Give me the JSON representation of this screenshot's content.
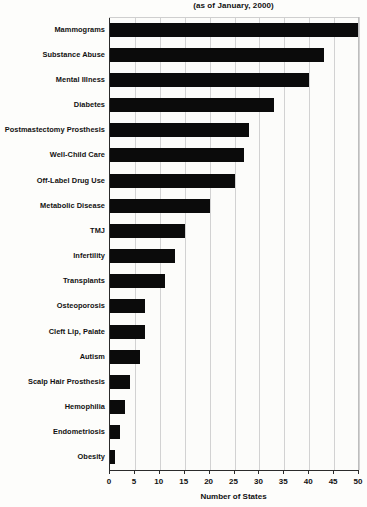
{
  "chart": {
    "subtitle": "(as of January, 2000)",
    "xlabel": "Number of States",
    "bar_color": "#0b0b0b",
    "grid_color": "#d2d2d2",
    "axis_color": "#2b2b2b",
    "background": "#fdfdfb"
  },
  "chart_data": {
    "type": "bar",
    "orientation": "horizontal",
    "title": "",
    "subtitle": "(as of January, 2000)",
    "xlabel": "Number of States",
    "ylabel": "",
    "xlim": [
      0,
      50
    ],
    "xticks": [
      0,
      5,
      10,
      15,
      20,
      25,
      30,
      35,
      40,
      45,
      50
    ],
    "grid": true,
    "grid_axis": "x",
    "legend": false,
    "categories": [
      "Mammograms",
      "Substance Abuse",
      "Mental Illness",
      "Diabetes",
      "Postmastectomy Prosthesis",
      "Well-Child Care",
      "Off-Label Drug Use",
      "Metabolic Disease",
      "TMJ",
      "Infertility",
      "Transplants",
      "Osteoporosis",
      "Cleft Lip, Palate",
      "Autism",
      "Scalp Hair Prosthesis",
      "Hemophilia",
      "Endometriosis",
      "Obesity"
    ],
    "values": [
      50,
      43,
      40,
      33,
      28,
      27,
      25,
      20,
      15,
      13,
      11,
      7,
      7,
      6,
      4,
      3,
      2,
      1
    ]
  }
}
